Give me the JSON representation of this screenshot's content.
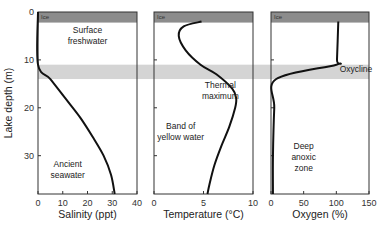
{
  "chart_data": {
    "type": "line",
    "shared_y": {
      "label": "Lake depth (m)",
      "ticks": [
        0,
        10,
        20,
        30
      ],
      "range": [
        0,
        38
      ],
      "inverted": true
    },
    "bands": [
      {
        "name": "Ice",
        "from": 0,
        "to": 2,
        "color": "#8c8c8c"
      },
      {
        "name": "Oxycline",
        "from": 11,
        "to": 14,
        "color": "#d4d4d4"
      }
    ],
    "panels": [
      {
        "xlabel": "Salinity (ppt)",
        "xticks": [
          0,
          10,
          20,
          30,
          40
        ],
        "xrange": [
          0,
          40
        ],
        "ice_label": "Ice",
        "annotations": [
          {
            "text": "Surface\nfreshwater",
            "x": 20,
            "y": 5.5
          },
          {
            "text": "Ancient\nseawater",
            "x": 12,
            "y": 33.5
          }
        ],
        "series": {
          "depth": [
            0,
            11,
            14,
            18,
            22,
            26,
            30,
            34,
            38
          ],
          "value": [
            0,
            0,
            5,
            11,
            17,
            22,
            26.5,
            29.5,
            31
          ]
        }
      },
      {
        "xlabel": "Temperature (°C)",
        "xticks": [
          0,
          5,
          10
        ],
        "xrange": [
          0,
          10
        ],
        "ice_label": "Ice",
        "band_label": "",
        "annotations": [
          {
            "text": "Thermal\nmaximum",
            "x": 6.7,
            "y": 17
          },
          {
            "text": "Band of\nyellow water",
            "x": 2.7,
            "y": 25.5
          }
        ],
        "series": {
          "depth": [
            2,
            3,
            5,
            8,
            11,
            13,
            16,
            18,
            20,
            24,
            28,
            32,
            36,
            38
          ],
          "value": [
            4.8,
            3,
            2.5,
            3.2,
            4.7,
            6.3,
            7.9,
            8.3,
            8.2,
            7.6,
            6.8,
            6.1,
            5.6,
            5.4
          ]
        }
      },
      {
        "xlabel": "Oxygen (%)",
        "xticks": [
          0,
          50,
          100,
          150
        ],
        "xrange": [
          0,
          150
        ],
        "ice_label": "Ice",
        "annotations": [
          {
            "text": "Oxycline",
            "x": 130,
            "y": 12.5
          },
          {
            "text": "Deep\nanoxic\nzone",
            "x": 50,
            "y": 31
          }
        ],
        "series": {
          "depth": [
            2,
            10,
            11,
            14,
            20,
            30,
            38
          ],
          "value": [
            103,
            101,
            100,
            8,
            5,
            3,
            3
          ]
        }
      }
    ]
  }
}
